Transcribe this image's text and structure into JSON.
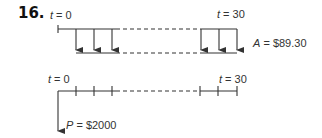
{
  "problem": {
    "number": "16."
  },
  "annuity_diagram": {
    "start_label_var": "t",
    "start_label_eq": " = 0",
    "end_label_var": "t",
    "end_label_eq": " = 30",
    "payment_label_var": "A",
    "payment_label_eq": " = $89.30",
    "arrows_shown": 6,
    "direction": "down"
  },
  "present_value_diagram": {
    "start_label_var": "t",
    "start_label_eq": " = 0",
    "end_label_var": "t",
    "end_label_eq": " = 30",
    "pv_label_var": "P",
    "pv_label_eq": " = $2000",
    "ticks_shown": 6,
    "direction": "down"
  },
  "colors": {
    "line": "#333333",
    "background": "#ffffff"
  }
}
